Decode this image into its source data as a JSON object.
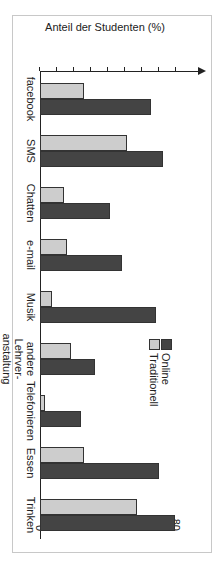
{
  "chart_data": {
    "type": "bar",
    "orientation": "vertical (image rotated 90° clockwise)",
    "title": "",
    "xlabel": "",
    "ylabel": "Anteil der Studenten (%)",
    "ylim": [
      0,
      85
    ],
    "yticks": [
      0,
      10,
      20,
      30,
      40,
      50,
      60,
      70,
      80
    ],
    "grid": false,
    "legend_position": "upper middle",
    "categories": [
      "facebook",
      "SMS",
      "Chatten",
      "e-mail",
      "Musik",
      "andere Lehrver-anstaltung",
      "Telefonieren",
      "Essen",
      "Trinken"
    ],
    "series": [
      {
        "name": "Online",
        "color": "#444444",
        "values": [
          65,
          72,
          41,
          48,
          68,
          32,
          24,
          70,
          79
        ]
      },
      {
        "name": "Traditionell",
        "color": "#cdcdcd",
        "values": [
          26,
          51,
          14,
          16,
          7,
          18,
          3,
          26,
          57
        ]
      }
    ]
  },
  "labels": {
    "ylabel": "Anteil der Studenten (%)",
    "legend_online": "Online",
    "legend_trad": "Traditionell",
    "cat_lines": [
      [
        "facebook"
      ],
      [
        "SMS"
      ],
      [
        "Chatten"
      ],
      [
        "e-mail"
      ],
      [
        "Musik"
      ],
      [
        "andere",
        "Lehrver-",
        "anstaltung"
      ],
      [
        "Telefonieren"
      ],
      [
        "Essen"
      ],
      [
        "Trinken"
      ]
    ]
  }
}
